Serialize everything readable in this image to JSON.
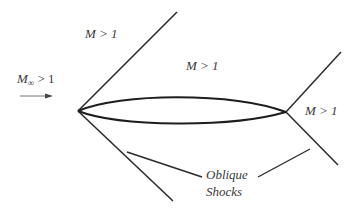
{
  "diagram": {
    "labels": {
      "freestream": {
        "symbol": "M",
        "subscript": "∞",
        "relation": " > 1"
      },
      "upper_region": "M > 1",
      "mid_region": "M > 1",
      "trailing_region": "M > 1",
      "shocks_line1": "Oblique",
      "shocks_line2": "Shocks"
    },
    "colors": {
      "line": "#2b2b2b",
      "text": "#3a3a3a",
      "arrow": "#555555",
      "background": "#ffffff"
    },
    "geometry": {
      "leading_edge": [
        78,
        111
      ],
      "trailing_edge": [
        286,
        112
      ],
      "leading_shock_upper_end": [
        177,
        12
      ],
      "leading_shock_lower_end": [
        173,
        201
      ],
      "trailing_shock_upper_end": [
        341,
        52
      ],
      "trailing_shock_lower_end": [
        338,
        165
      ]
    }
  }
}
